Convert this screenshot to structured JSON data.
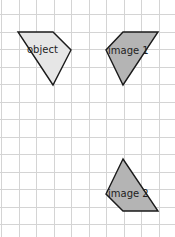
{
  "diagram": {
    "type": "transformation-grid",
    "grid": {
      "cell_size": 17.5,
      "origin_x": 1,
      "origin_y": 14,
      "line_color": "#d4d4d4"
    },
    "shapes": [
      {
        "id": "object",
        "label": "object",
        "fill": "#e6e6e6",
        "points": "18,32 53,32 71,50 53,85",
        "label_x": 27,
        "label_y": 53
      },
      {
        "id": "image1",
        "label": "image 1",
        "fill": "#b4b4b4",
        "points": "123,32 158,32 123,85 106,50",
        "label_x": 108,
        "label_y": 54
      },
      {
        "id": "image2",
        "label": "image 2",
        "fill": "#b4b4b4",
        "points": "123,159 106,194 123,211 158,211",
        "label_x": 108,
        "label_y": 197
      }
    ]
  }
}
